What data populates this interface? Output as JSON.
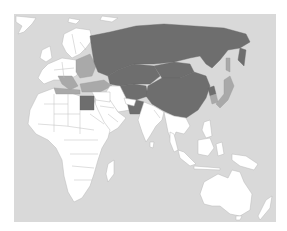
{
  "map": {
    "projection": "Eastern hemisphere (Europe, Africa, Asia, Oceania)",
    "colors": {
      "ocean": "#d9d9d9",
      "land_default": "#ffffff",
      "highlight_dark": "#6e6e6e",
      "highlight_medium": "#a9a9a9",
      "border": "#b9b9b9"
    },
    "regions": {
      "highlight_dark": [
        "Russia",
        "Kazakhstan",
        "China",
        "Mongolia",
        "Central Asia",
        "Egypt",
        "Pakistan",
        "North Korea"
      ],
      "highlight_medium": [
        "Turkey",
        "Mediterranean Europe",
        "Eastern Europe",
        "Japan",
        "South Korea",
        "Libya coast"
      ],
      "default": [
        "Western Europe",
        "Scandinavia",
        "Africa",
        "Arabian Peninsula",
        "Iran",
        "India",
        "Southeast Asia",
        "Indonesia",
        "Australia",
        "New Zealand"
      ]
    }
  }
}
